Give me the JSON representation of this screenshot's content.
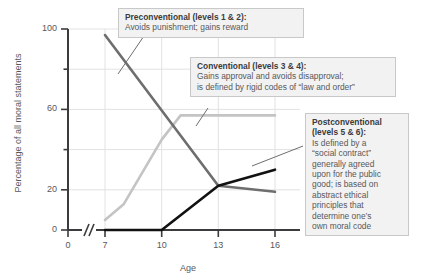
{
  "chart_data": {
    "type": "line",
    "title": "",
    "xlabel": "Age",
    "ylabel": "Percentage of all moral statements",
    "xlim": [
      7,
      16
    ],
    "ylim": [
      0,
      100
    ],
    "x_ticks": [
      "0",
      "7",
      "10",
      "13",
      "16"
    ],
    "y_ticks": [
      "0",
      "20",
      "60",
      "100"
    ],
    "y_minor_ticks": [
      "40",
      "80"
    ],
    "axis_break": true,
    "grid": true,
    "legend": "none",
    "x": [
      7,
      10,
      13,
      16
    ],
    "series": [
      {
        "name": "Preconventional (levels 1 & 2)",
        "color": "#6e6e6e",
        "values": [
          97,
          56,
          22,
          19
        ]
      },
      {
        "name": "Conventional (levels 3 & 4)",
        "color": "#c4c4c4",
        "values": [
          5,
          45,
          57,
          57
        ]
      },
      {
        "name": "Postconventional (levels 5 & 6)",
        "color": "#111111",
        "values": [
          0,
          0,
          22,
          30
        ]
      }
    ],
    "annotations": [
      {
        "id": "preconventional",
        "title": "Preconventional (levels 1 & 2):",
        "lines": [
          "Avoids punishment; gains reward"
        ]
      },
      {
        "id": "conventional",
        "title": "Conventional (levels 3 & 4):",
        "lines": [
          "Gains approval and avoids disapproval;",
          "is defined by rigid codes of “law and order”"
        ]
      },
      {
        "id": "postconventional",
        "title": "Postconventional",
        "title2": "(levels 5 & 6):",
        "lines": [
          "Is defined by a",
          "“social contract”",
          "generally agreed",
          "upon for the public",
          "good; is based on",
          "abstract ethical",
          "principles that",
          "determine one’s",
          "own moral code"
        ]
      }
    ]
  }
}
